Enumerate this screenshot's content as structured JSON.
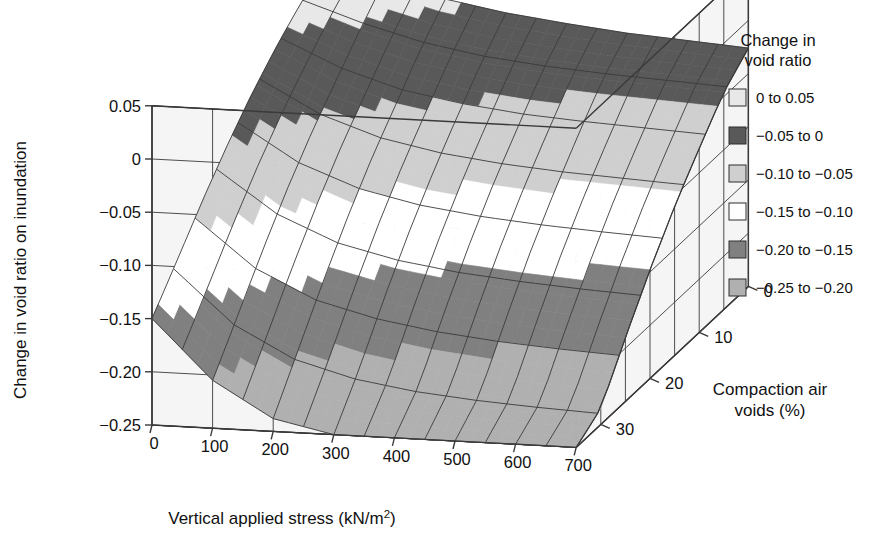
{
  "chart_data": {
    "type": "surface",
    "title": "",
    "xlabel": "Vertical applied stress (kN/m2)",
    "xlabel_base": "Vertical applied stress (kN/m",
    "xlabel_sup": "2",
    "xlabel_tail": ")",
    "ylabel": "Compaction air voids (%)",
    "ylabel_line1": "Compaction air",
    "ylabel_line2": "voids (%)",
    "zlabel": "Change in void ratio on inundation",
    "x_ticks": [
      "0",
      "100",
      "200",
      "300",
      "400",
      "500",
      "600",
      "700"
    ],
    "x_values": [
      0,
      100,
      200,
      300,
      400,
      500,
      600,
      700
    ],
    "xlim": [
      0,
      700
    ],
    "y_ticks": [
      "0",
      "10",
      "20",
      "30"
    ],
    "y_values": [
      0,
      10,
      20,
      30
    ],
    "ylim": [
      0,
      35
    ],
    "z_ticks": [
      "0.05",
      "0",
      "-0.05",
      "-0.10",
      "-0.15",
      "-0.20",
      "-0.25"
    ],
    "z_values": [
      0.05,
      0,
      -0.05,
      -0.1,
      -0.15,
      -0.2,
      -0.25
    ],
    "zlim": [
      -0.25,
      0.05
    ],
    "grid": true,
    "legend_position": "right",
    "legend_title_line1": "Change in",
    "legend_title_line2": "void ratio",
    "legend": [
      {
        "label": "0 to 0.05",
        "color": "#e8e8e8",
        "range": [
          0,
          0.05
        ]
      },
      {
        "label": "-0.05 to 0",
        "color": "#595959",
        "range": [
          -0.05,
          0
        ]
      },
      {
        "label": "-0.10 to -0.05",
        "color": "#cfcfcf",
        "range": [
          -0.1,
          -0.05
        ]
      },
      {
        "label": "-0.15 to -0.10",
        "color": "#ffffff",
        "range": [
          -0.15,
          -0.1
        ]
      },
      {
        "label": "-0.20 to -0.15",
        "color": "#808080",
        "range": [
          -0.2,
          -0.15
        ]
      },
      {
        "label": "-0.25 to -0.20",
        "color": "#b0b0b0",
        "range": [
          -0.25,
          -0.2
        ]
      }
    ],
    "surface_note": "Change in void ratio on inundation as a function of vertical applied stress and compaction air voids",
    "surface_z_grid": [
      [
        0.03,
        0.02,
        0.005,
        -0.005,
        -0.012,
        -0.018,
        -0.022,
        -0.026
      ],
      [
        0.015,
        -0.005,
        -0.02,
        -0.03,
        -0.036,
        -0.04,
        -0.043,
        -0.046
      ],
      [
        -0.005,
        -0.032,
        -0.05,
        -0.06,
        -0.067,
        -0.071,
        -0.074,
        -0.077
      ],
      [
        -0.028,
        -0.06,
        -0.08,
        -0.092,
        -0.099,
        -0.104,
        -0.107,
        -0.11
      ],
      [
        -0.055,
        -0.092,
        -0.115,
        -0.128,
        -0.136,
        -0.141,
        -0.145,
        -0.148
      ],
      [
        -0.085,
        -0.128,
        -0.154,
        -0.168,
        -0.177,
        -0.183,
        -0.187,
        -0.19
      ],
      [
        -0.118,
        -0.167,
        -0.196,
        -0.212,
        -0.222,
        -0.228,
        -0.232,
        -0.235
      ],
      [
        -0.15,
        -0.205,
        -0.238,
        -0.25,
        -0.25,
        -0.25,
        -0.25,
        -0.25
      ]
    ],
    "surface_x_axis": [
      0,
      100,
      200,
      300,
      400,
      500,
      600,
      700
    ],
    "surface_y_axis": [
      0,
      5,
      10,
      15,
      20,
      25,
      30,
      35
    ]
  },
  "colors": {
    "floor": "#eeeeee",
    "wall": "#f5f5f5",
    "line": "#3a3a3a",
    "text": "#111111"
  }
}
